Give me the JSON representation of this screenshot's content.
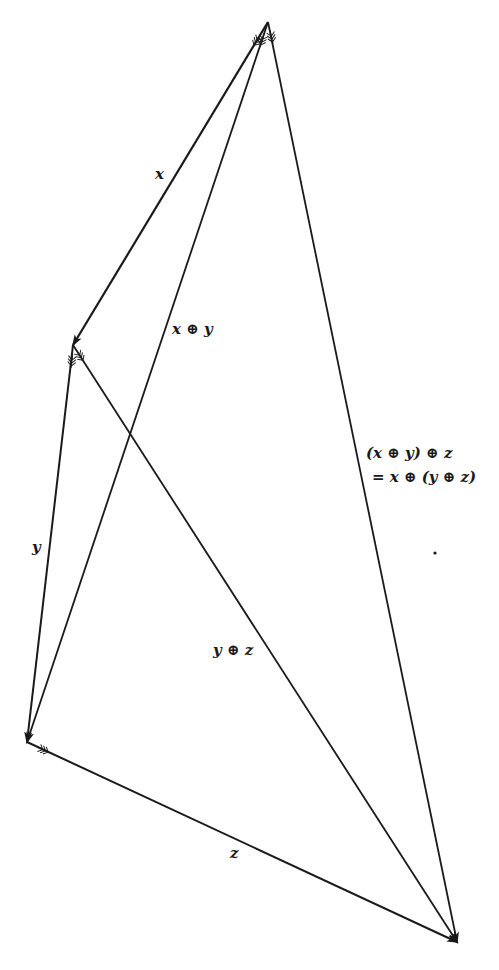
{
  "diagram": {
    "type": "vector addition associativity",
    "line_color": "#1a1a1a",
    "vertices": {
      "A": [
        268,
        22
      ],
      "B": [
        73,
        345
      ],
      "C": [
        27,
        742
      ],
      "D": [
        457,
        942
      ]
    },
    "edges": [
      {
        "from": "A",
        "to": "B",
        "label": "x"
      },
      {
        "from": "B",
        "to": "C",
        "label": "y"
      },
      {
        "from": "C",
        "to": "D",
        "label": "z"
      },
      {
        "from": "A",
        "to": "C",
        "label": "x ⊕ y"
      },
      {
        "from": "B",
        "to": "D",
        "label": "y ⊕ z"
      },
      {
        "from": "A",
        "to": "D",
        "label": "(x ⊕ y) ⊕ z = x ⊕ (y ⊕ z)"
      }
    ]
  },
  "labels": {
    "x": "x",
    "y": "y",
    "z": "z",
    "x_plus_y": "x ⊕ y",
    "y_plus_z": "y ⊕ z",
    "assoc_line1": "(x ⊕ y) ⊕ z",
    "assoc_line2": "= x ⊕ (y ⊕ z)"
  }
}
